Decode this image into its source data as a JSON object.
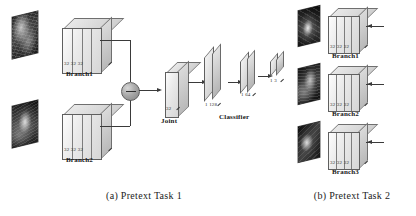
{
  "figure": {
    "panels": [
      {
        "id": "pretext-task-1",
        "caption": "(a) Pretext Task 1",
        "branches": [
          {
            "name": "Branch1",
            "dims": "32 32 32",
            "input_icon": "input-image-thumbnail"
          },
          {
            "name": "Branch2",
            "dims": "32 32 32",
            "input_icon": "input-image-thumbnail"
          }
        ],
        "merge": {
          "operator": "−",
          "icon": "subtract-node"
        },
        "joint": {
          "label": "Joint",
          "dims": "32"
        },
        "classifier": {
          "label": "Classifier",
          "layers": [
            {
              "dims": "1 128"
            },
            {
              "dims": "1 64"
            },
            {
              "dims": "1 3"
            }
          ]
        }
      },
      {
        "id": "pretext-task-2",
        "caption": "(b) Pretext Task 2",
        "branches": [
          {
            "name": "Branch1",
            "dims": "32 32 32",
            "input_icon": "input-image-thumbnail"
          },
          {
            "name": "Branch2",
            "dims": "32 32 32",
            "input_icon": "input-image-thumbnail"
          },
          {
            "name": "Branch3",
            "dims": "32 32 32",
            "input_icon": "input-image-thumbnail"
          }
        ]
      }
    ]
  }
}
